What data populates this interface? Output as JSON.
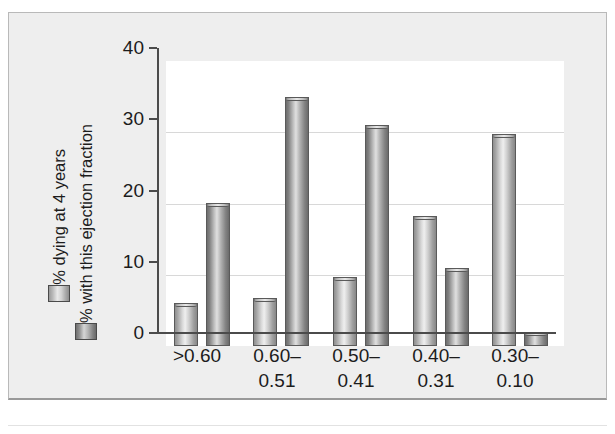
{
  "figure": {
    "panel_bg": "#eeeeee",
    "plot_bg": "#ffffff",
    "axis_color": "#4b4b4b",
    "grid_color": "#d8d8d8"
  },
  "legend": {
    "items": [
      {
        "label": "% dying at 4 years",
        "swatch": "light-gradient-swatch",
        "color": "#d9d9d9"
      },
      {
        "label": "% with this ejection fraction",
        "swatch": "dark-gradient-swatch",
        "color": "#a6a6a6"
      }
    ]
  },
  "chart_data": {
    "type": "bar",
    "title": "",
    "subtitle": "",
    "xlabel": "",
    "ylabel": "",
    "categories": [
      ">0.60",
      "0.60–\n0.51",
      "0.50–\n0.41",
      "0.40–\n0.31",
      "0.30–\n0.10"
    ],
    "series": [
      {
        "name": "% dying at 4 years",
        "values": [
          6.0,
          6.7,
          9.7,
          18.3,
          29.8
        ]
      },
      {
        "name": "% with this ejection fraction",
        "values": [
          20.0,
          35.0,
          31.0,
          11.0,
          2.0
        ]
      }
    ],
    "ylim": [
      0,
      40
    ],
    "yticks": [
      0,
      10,
      20,
      30,
      40
    ],
    "ytick_labels": [
      "0",
      "10",
      "20",
      "30",
      "40"
    ],
    "grid": true,
    "grid_axis": "y",
    "legend_position": "left-outside-vertical"
  }
}
